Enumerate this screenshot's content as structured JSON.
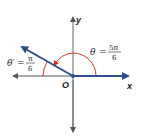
{
  "diagram": {
    "axes": {
      "x_label": "x",
      "y_label": "y",
      "origin_label": "O"
    },
    "angle": {
      "symbol": "θ",
      "equals": "=",
      "numerator": "5π",
      "denominator": "6"
    },
    "reference_angle": {
      "symbol": "θ′",
      "equals": "=",
      "numerator": "π",
      "denominator": "6"
    },
    "colors": {
      "ray": "#2b4f8c",
      "arc": "#d9352a",
      "axis": "#555555"
    }
  }
}
